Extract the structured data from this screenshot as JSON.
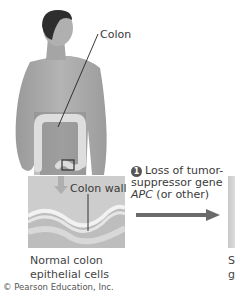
{
  "figure": {
    "labels": {
      "colon": "Colon",
      "colon_wall": "Colon wall"
    },
    "step1": {
      "number": "1",
      "line1": "Loss of tumor-",
      "line2": "suppressor gene",
      "gene": "APC",
      "line3_rest": " (or other)"
    },
    "captions": {
      "normal_line1": "Normal colon",
      "normal_line2": "epithelial cells",
      "next_line1": "Sı",
      "next_line2": "g"
    },
    "copyright": "© Pearson Education, Inc.",
    "colors": {
      "skin": "#a9a9a9",
      "hair": "#2e2e2e",
      "colon_tissue": "#d9d9d9",
      "arrow": "#6a6a6a",
      "leader_line": "#222222",
      "inset_bg": "#cfcfcf"
    }
  }
}
